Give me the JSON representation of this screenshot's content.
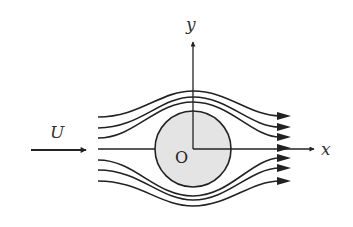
{
  "diagram": {
    "labels": {
      "y_axis": "y",
      "x_axis": "x",
      "freestream": "U",
      "origin": "O"
    },
    "colors": {
      "stroke": "#222222",
      "cylinder_fill": "#e4e4e4",
      "background": "#ffffff"
    },
    "cylinder": {
      "cx": 193,
      "cy": 149,
      "r": 38
    },
    "streamline_count": 7,
    "streamlines": [
      {
        "start_y": 117,
        "peak_y": 91,
        "end_y": 116
      },
      {
        "start_y": 128,
        "peak_y": 97,
        "end_y": 127
      },
      {
        "start_y": 138,
        "peak_y": 102,
        "end_y": 137
      },
      {
        "start_y": 149,
        "peak_y": 149,
        "end_y": 148
      },
      {
        "start_y": 160,
        "peak_y": 196,
        "end_y": 158
      },
      {
        "start_y": 170,
        "peak_y": 200,
        "end_y": 168
      },
      {
        "start_y": 181,
        "peak_y": 206,
        "end_y": 181
      }
    ]
  }
}
